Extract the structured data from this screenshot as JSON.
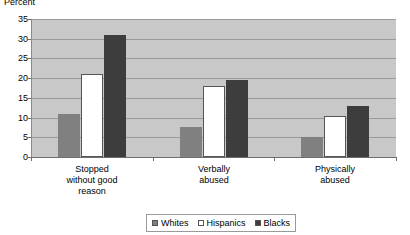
{
  "chart_data": {
    "type": "bar",
    "title": "",
    "xlabel": "",
    "ylabel": "Percent",
    "ylim": [
      0,
      35
    ],
    "ytick_values": [
      35,
      30,
      25,
      20,
      15,
      10,
      5,
      0
    ],
    "ytick_labels": [
      "35",
      "30",
      "25",
      "20",
      "15",
      "10",
      "5",
      "0"
    ],
    "grid": true,
    "legend_position": "bottom",
    "categories": [
      "Stopped without good reason",
      "Verbally abused",
      "Physically abused"
    ],
    "category_label_lines": [
      [
        "Stopped",
        "without good",
        "reason"
      ],
      [
        "Verbally",
        "abused"
      ],
      [
        "Physically",
        "abused"
      ]
    ],
    "series": [
      {
        "name": "Whites",
        "color": "#808080",
        "values": [
          11,
          7.5,
          5
        ]
      },
      {
        "name": "Hispanics",
        "color": "#ffffff",
        "values": [
          21,
          18,
          10.5
        ]
      },
      {
        "name": "Blacks",
        "color": "#3d3d3d",
        "values": [
          31,
          19.5,
          13
        ]
      }
    ]
  },
  "legend": {
    "items": [
      {
        "label": "Whites"
      },
      {
        "label": "Hispanics"
      },
      {
        "label": "Blacks"
      }
    ]
  },
  "colors": {
    "plot_background": "#c8c8c8",
    "gridline": "#9a9a9a",
    "axis": "#6e6e6e",
    "whites": "#808080",
    "hispanics": "#ffffff",
    "blacks": "#3d3d3d"
  }
}
